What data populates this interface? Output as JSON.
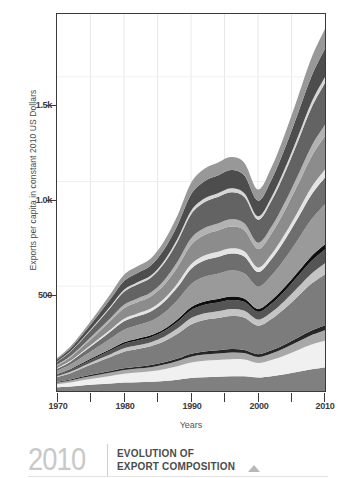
{
  "figure": {
    "ylabel": "Exports per capita in constant 2010 US Dollars",
    "xlabel": "Years"
  },
  "caption": {
    "year": "2010",
    "line1": "EVOLUTION OF",
    "line2": "EXPORT COMPOSITION",
    "marker_icon": "triangle-up-icon"
  },
  "chart_data": {
    "type": "area",
    "title": "",
    "subtitle": "",
    "xlabel": "Years",
    "ylabel": "Exports per capita in constant 2010 US Dollars",
    "xlim": [
      1970,
      2010
    ],
    "ylim": [
      0,
      1800
    ],
    "ytick_labels": [
      "500",
      "1.0k",
      "1.5k"
    ],
    "ytick_values": [
      500,
      1000,
      1500
    ],
    "xtick_labels": [
      "1970",
      "1980",
      "1990",
      "2000",
      "2010"
    ],
    "xtick_values": [
      1970,
      1980,
      1990,
      2000,
      2010
    ],
    "minor_xtick_values": [
      1975,
      1985,
      1995,
      2005
    ],
    "grid": true,
    "legend": "none",
    "stacked": true,
    "x": [
      1970,
      1972,
      1974,
      1976,
      1978,
      1980,
      1982,
      1984,
      1986,
      1988,
      1990,
      1992,
      1994,
      1996,
      1998,
      2000,
      2002,
      2004,
      2006,
      2008,
      2010
    ],
    "series": [
      {
        "name": "band-01",
        "color": "#808080",
        "values": [
          18,
          22,
          28,
          32,
          36,
          40,
          42,
          44,
          48,
          54,
          62,
          66,
          68,
          70,
          70,
          64,
          70,
          80,
          92,
          104,
          112
        ]
      },
      {
        "name": "band-02",
        "color": "#f0f0f0",
        "values": [
          14,
          18,
          24,
          30,
          36,
          42,
          46,
          50,
          56,
          64,
          74,
          78,
          80,
          82,
          80,
          70,
          78,
          90,
          104,
          118,
          128
        ]
      },
      {
        "name": "band-03",
        "color": "#a8a8a8",
        "values": [
          8,
          10,
          12,
          14,
          16,
          18,
          19,
          20,
          22,
          25,
          28,
          30,
          31,
          32,
          31,
          28,
          31,
          35,
          40,
          45,
          50
        ]
      },
      {
        "name": "band-04",
        "color": "#262626",
        "values": [
          4,
          5,
          6,
          7,
          8,
          9,
          9,
          10,
          11,
          12,
          14,
          15,
          15,
          16,
          15,
          14,
          15,
          17,
          20,
          22,
          24
        ]
      },
      {
        "name": "band-05",
        "color": "#7c7c7c",
        "values": [
          22,
          30,
          42,
          54,
          66,
          78,
          84,
          90,
          100,
          118,
          140,
          150,
          154,
          158,
          154,
          136,
          150,
          172,
          198,
          224,
          244
        ]
      },
      {
        "name": "band-06",
        "color": "#c4c4c4",
        "values": [
          5,
          7,
          9,
          12,
          14,
          17,
          18,
          19,
          22,
          26,
          30,
          32,
          33,
          34,
          33,
          29,
          32,
          37,
          42,
          48,
          52
        ]
      },
      {
        "name": "band-07",
        "color": "#555555",
        "values": [
          6,
          8,
          11,
          14,
          18,
          21,
          23,
          24,
          27,
          32,
          38,
          41,
          42,
          43,
          42,
          37,
          41,
          47,
          54,
          61,
          66
        ]
      },
      {
        "name": "band-08",
        "color": "#0f0f0f",
        "values": [
          3,
          4,
          5,
          6,
          7,
          8,
          9,
          9,
          10,
          12,
          14,
          15,
          16,
          16,
          16,
          14,
          16,
          18,
          20,
          23,
          25
        ]
      },
      {
        "name": "band-09",
        "color": "#9a9a9a",
        "values": [
          16,
          22,
          30,
          40,
          50,
          60,
          64,
          68,
          78,
          92,
          110,
          118,
          121,
          124,
          120,
          106,
          118,
          135,
          155,
          176,
          191
        ]
      },
      {
        "name": "band-10",
        "color": "#6e6e6e",
        "values": [
          10,
          14,
          20,
          26,
          33,
          40,
          43,
          46,
          52,
          61,
          73,
          78,
          80,
          82,
          80,
          70,
          78,
          90,
          103,
          117,
          127
        ]
      },
      {
        "name": "band-11",
        "color": "#e4e4e4",
        "values": [
          3,
          4,
          6,
          8,
          10,
          12,
          13,
          14,
          16,
          19,
          22,
          24,
          25,
          25,
          25,
          22,
          24,
          28,
          32,
          36,
          39
        ]
      },
      {
        "name": "band-12",
        "color": "#8c8c8c",
        "values": [
          12,
          17,
          24,
          32,
          41,
          50,
          54,
          57,
          65,
          77,
          92,
          98,
          101,
          103,
          100,
          88,
          98,
          113,
          129,
          146,
          159
        ]
      },
      {
        "name": "band-13",
        "color": "#b2b2b2",
        "values": [
          4,
          6,
          8,
          11,
          14,
          17,
          18,
          19,
          22,
          26,
          31,
          33,
          34,
          35,
          34,
          30,
          33,
          38,
          44,
          50,
          54
        ]
      },
      {
        "name": "band-14",
        "color": "#636363",
        "values": [
          14,
          20,
          29,
          39,
          50,
          62,
          67,
          71,
          81,
          96,
          115,
          123,
          126,
          129,
          125,
          110,
          123,
          141,
          162,
          183,
          199
        ]
      },
      {
        "name": "band-15",
        "color": "#d6d6d6",
        "values": [
          2,
          3,
          4,
          6,
          7,
          9,
          10,
          10,
          12,
          14,
          17,
          18,
          18,
          19,
          18,
          16,
          18,
          21,
          24,
          27,
          29
        ]
      },
      {
        "name": "band-16",
        "color": "#4d4d4d",
        "values": [
          9,
          13,
          19,
          26,
          34,
          42,
          45,
          48,
          55,
          65,
          78,
          83,
          85,
          87,
          85,
          75,
          83,
          96,
          110,
          124,
          135
        ]
      },
      {
        "name": "band-17",
        "color": "#989898",
        "values": [
          6,
          9,
          13,
          18,
          24,
          30,
          32,
          34,
          39,
          46,
          55,
          59,
          61,
          62,
          60,
          53,
          59,
          68,
          78,
          88,
          96
        ]
      }
    ]
  }
}
